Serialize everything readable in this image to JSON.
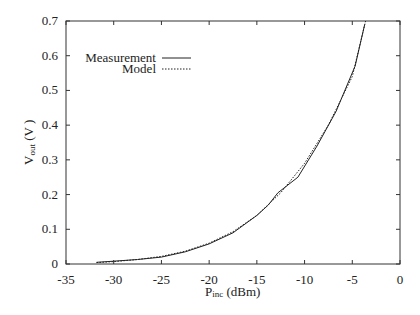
{
  "chart_data": {
    "type": "line",
    "title": "",
    "xlabel": "P_inc (dBm)",
    "xlabel_main": "P",
    "xlabel_sub": "inc",
    "xlabel_rest": " (dBm)",
    "ylabel": "V_out (V )",
    "ylabel_main": "V",
    "ylabel_sub": "out",
    "ylabel_rest": " (V )",
    "xlim": [
      -35,
      0
    ],
    "ylim": [
      0,
      0.7
    ],
    "xticks": [
      -35,
      -30,
      -25,
      -20,
      -15,
      -10,
      -5,
      0
    ],
    "xtick_labels": [
      "-35",
      "-30",
      "-25",
      "-20",
      "-15",
      "-10",
      "-5",
      "0"
    ],
    "yticks": [
      0,
      0.1,
      0.2,
      0.3,
      0.4,
      0.5,
      0.6,
      0.7
    ],
    "ytick_labels": [
      "0",
      "0.1",
      "0.2",
      "0.3",
      "0.4",
      "0.5",
      "0.6",
      "0.7"
    ],
    "grid": false,
    "legend_position": "upper-left",
    "series": [
      {
        "name": "Measurement",
        "style": "solid",
        "x": [
          -31.8,
          -30,
          -27.5,
          -25,
          -22.5,
          -20,
          -17.5,
          -15,
          -13.8,
          -12.8,
          -10.7,
          -8.7,
          -6.7,
          -4.7,
          -3.7
        ],
        "y": [
          0.005,
          0.008,
          0.013,
          0.02,
          0.035,
          0.058,
          0.09,
          0.14,
          0.17,
          0.205,
          0.25,
          0.34,
          0.44,
          0.57,
          0.69
        ]
      },
      {
        "name": "Model",
        "style": "dotted",
        "x": [
          -31.8,
          -30,
          -27.5,
          -25,
          -22.5,
          -20,
          -17.5,
          -15,
          -12.5,
          -10,
          -7.5,
          -5,
          -3.6
        ],
        "y": [
          0.004,
          0.007,
          0.013,
          0.022,
          0.037,
          0.06,
          0.093,
          0.14,
          0.205,
          0.29,
          0.4,
          0.54,
          0.7
        ]
      }
    ]
  }
}
